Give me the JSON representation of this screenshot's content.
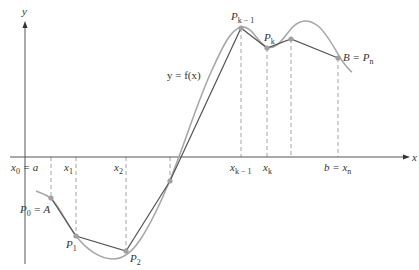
{
  "figure": {
    "type": "polygonal-approximation-of-curve",
    "colors": {
      "axis": "#555555",
      "curve": "#a8a8a8",
      "polygon": "#555555",
      "dashed": "#9a9a9a",
      "point": "#a0a0a0",
      "text": "#333333"
    },
    "axes": {
      "x_label": "x",
      "y_label": "y"
    },
    "curve_label": "y = f(x)",
    "x_ticks": [
      {
        "main": "x",
        "sub": "0",
        "suffix": " = a"
      },
      {
        "main": "x",
        "sub": "1",
        "suffix": ""
      },
      {
        "main": "x",
        "sub": "2",
        "suffix": ""
      },
      {
        "main": "x",
        "sub": "k − 1",
        "suffix": ""
      },
      {
        "main": "x",
        "sub": "k",
        "suffix": ""
      },
      {
        "prefix": "b = ",
        "main": "x",
        "sub": "n",
        "suffix": ""
      }
    ],
    "points": [
      {
        "main": "P",
        "sub": "0",
        "suffix": " = A"
      },
      {
        "main": "P",
        "sub": "1",
        "suffix": ""
      },
      {
        "main": "P",
        "sub": "2",
        "suffix": ""
      },
      {
        "main": "P",
        "sub": "k − 1",
        "suffix": ""
      },
      {
        "main": "P",
        "sub": "k",
        "suffix": ""
      },
      {
        "prefix": "B = ",
        "main": "P",
        "sub": "n",
        "suffix": ""
      }
    ]
  }
}
